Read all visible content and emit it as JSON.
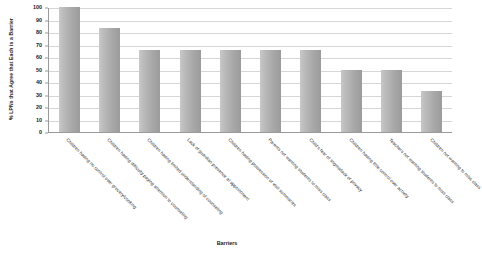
{
  "chart_data": {
    "type": "bar",
    "title": "",
    "xlabel": "Barriers",
    "ylabel": "% LPNs that Agree that Each is a Barrier",
    "ylim": [
      0,
      100
    ],
    "ytick_labels": [
      "100",
      "90",
      "80",
      "70",
      "60",
      "50",
      "40",
      "30",
      "20",
      "10",
      "0"
    ],
    "ytick_values": [
      100,
      90,
      80,
      70,
      60,
      50,
      40,
      30,
      20,
      10,
      0
    ],
    "grid": true,
    "legend": "none",
    "categories": [
      "Children having no control over grocery/cooking",
      "Children having difficulty paying attention to counseling",
      "Children having limited understanding of counseling",
      "Lack of guardian presence at appointment",
      "Children having possession of visit summaries",
      "Parents not wanting students to miss class",
      "Child's fear of stigma/lack of privacy",
      "Children having little control over activity",
      "Teachers not wanting students to miss class",
      "Children not wanting to miss class"
    ],
    "values": [
      100,
      83,
      66,
      66,
      66,
      66,
      66,
      50,
      50,
      33
    ],
    "bar_color_left": "#c8c8c8",
    "bar_color_right": "#9b9b9b",
    "gridline_color": "#d6d6d6",
    "axis_color": "#9a9a9a"
  }
}
